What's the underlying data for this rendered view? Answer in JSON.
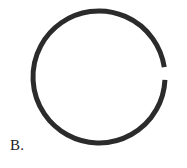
{
  "figure": {
    "label": "B.",
    "background_color": "#ffffff",
    "shape": {
      "name": "open-ring",
      "description": "nearly closed circular ring with a small gap on the right side",
      "stroke_color": "#2b2b2b",
      "stroke_width": 5,
      "fill": "none",
      "center_x": 99,
      "center_y": 77,
      "radius": 66,
      "gap": {
        "present": true,
        "side": "right",
        "center_angle_deg": -3,
        "span_deg": 11
      }
    }
  }
}
